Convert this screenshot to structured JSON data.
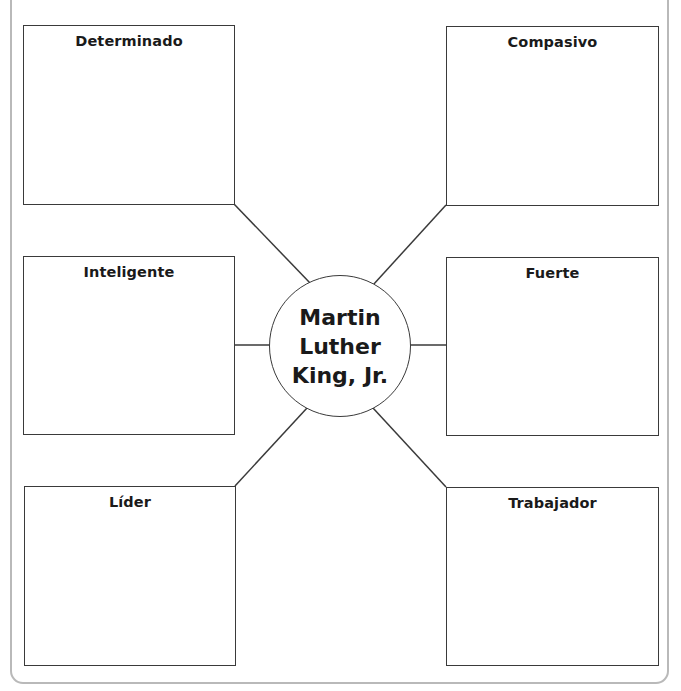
{
  "diagram": {
    "type": "character-trait web",
    "center": {
      "lines": [
        "Martin",
        "Luther",
        "King, Jr."
      ]
    },
    "traits": [
      {
        "position": "top-left",
        "label": "Determinado"
      },
      {
        "position": "top-right",
        "label": "Compasivo"
      },
      {
        "position": "middle-left",
        "label": "Inteligente"
      },
      {
        "position": "middle-right",
        "label": "Fuerte"
      },
      {
        "position": "bottom-left",
        "label": "Líder"
      },
      {
        "position": "bottom-right",
        "label": "Trabajador"
      }
    ],
    "colors": {
      "line": "#3a3a3a",
      "frame": "#b9b9b9",
      "text": "#1a1a1a",
      "background": "#ffffff"
    }
  }
}
